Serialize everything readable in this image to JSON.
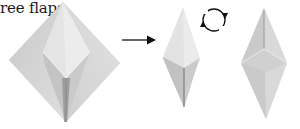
{
  "diagram": {
    "caption_fragment": "ree flaps.",
    "steps": [
      {
        "id": "step-a",
        "shape": "diamond-with-inner-kite",
        "description": "folded base with lower flaps"
      },
      {
        "id": "arrow",
        "shape": "right-arrow"
      },
      {
        "id": "step-b",
        "shape": "narrow-kite-folded"
      },
      {
        "id": "flip-symbol",
        "shape": "turn-over-icon"
      },
      {
        "id": "step-c",
        "shape": "narrow-kite-result"
      }
    ],
    "colors": {
      "paper_light": "#e9e9e9",
      "paper_mid": "#d0d0d0",
      "paper_dark": "#a8a8a8",
      "crease": "#8a8a8a",
      "ink": "#111111",
      "background": "#ffffff"
    }
  }
}
